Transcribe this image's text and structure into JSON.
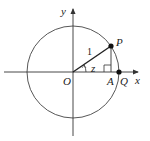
{
  "diagram": {
    "type": "unit-circle",
    "colors": {
      "stroke": "#333333",
      "background": "#ffffff"
    },
    "labels": {
      "y_axis": "y",
      "x_axis": "x",
      "origin": "O",
      "point_p": "P",
      "point_a": "A",
      "point_q": "Q",
      "angle": "z",
      "radius": "1"
    }
  }
}
